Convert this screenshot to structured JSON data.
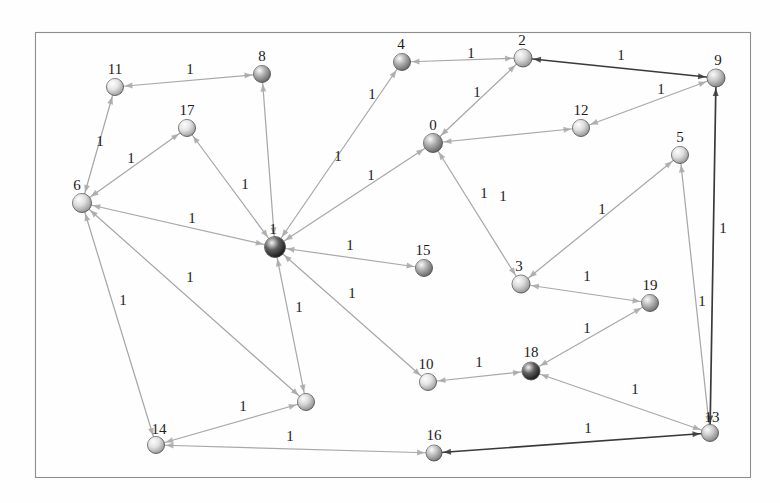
{
  "figure": {
    "type": "node-link-graph",
    "frame": {
      "x": 35,
      "y": 32,
      "width": 715,
      "height": 445,
      "stroke": "#8d8d8d"
    },
    "background": "#fefefe",
    "default_edge_color": "#a8a8a8",
    "highlight_edge_color": "#3a3a3a",
    "node_label_color": "#1c1c1c",
    "edge_label_color": "#1c1c1c"
  },
  "chart_data": {
    "type": "graph",
    "title": "",
    "node_count": 20,
    "edge_count": 27,
    "all_edge_weights_equal": true,
    "weight_value": "1",
    "nodes": [
      {
        "id": "0",
        "label": "0",
        "x": 433,
        "y": 143,
        "r": 9.5,
        "fill": "#8a8a8a",
        "label_dx": 0,
        "label_dy": -13
      },
      {
        "id": "1",
        "label": "1",
        "x": 275,
        "y": 247,
        "r": 10.5,
        "fill": "#1a1a1a",
        "label_dx": -2,
        "label_dy": -13
      },
      {
        "id": "2",
        "label": "2",
        "x": 523,
        "y": 58,
        "r": 9.0,
        "fill": "#c9c9c9",
        "label_dx": -1,
        "label_dy": -13
      },
      {
        "id": "3",
        "label": "3",
        "x": 521,
        "y": 284,
        "r": 9.0,
        "fill": "#cccccc",
        "label_dx": -2,
        "label_dy": -13
      },
      {
        "id": "4",
        "label": "4",
        "x": 402,
        "y": 62,
        "r": 8.5,
        "fill": "#8f8f8f",
        "label_dx": -1,
        "label_dy": -13
      },
      {
        "id": "5",
        "label": "5",
        "x": 680,
        "y": 155,
        "r": 8.5,
        "fill": "#d4d4d4",
        "label_dx": 0,
        "label_dy": -13
      },
      {
        "id": "6",
        "label": "6",
        "x": 82,
        "y": 203,
        "r": 9.5,
        "fill": "#cfcfcf",
        "label_dx": -5,
        "label_dy": -13
      },
      {
        "id": "7",
        "label": "",
        "x": 306,
        "y": 402,
        "r": 8.5,
        "fill": "#c6c6c6",
        "label_dx": 0,
        "label_dy": -13
      },
      {
        "id": "8",
        "label": "8",
        "x": 262,
        "y": 74,
        "r": 8.5,
        "fill": "#8b8b8b",
        "label_dx": 0,
        "label_dy": -13
      },
      {
        "id": "9",
        "label": "9",
        "x": 716,
        "y": 78,
        "r": 9.0,
        "fill": "#b3b3b3",
        "label_dx": 2,
        "label_dy": -13
      },
      {
        "id": "10",
        "label": "10",
        "x": 428,
        "y": 382,
        "r": 8.5,
        "fill": "#dadada",
        "label_dx": -2,
        "label_dy": -13
      },
      {
        "id": "11",
        "label": "11",
        "x": 115,
        "y": 87,
        "r": 8.5,
        "fill": "#dcdcdc",
        "label_dx": 0,
        "label_dy": -13
      },
      {
        "id": "12",
        "label": "12",
        "x": 581,
        "y": 128,
        "r": 8.5,
        "fill": "#d0d0d0",
        "label_dx": 0,
        "label_dy": -13
      },
      {
        "id": "13",
        "label": "13",
        "x": 710,
        "y": 433,
        "r": 8.5,
        "fill": "#b6b6b6",
        "label_dx": 2,
        "label_dy": -11
      },
      {
        "id": "14",
        "label": "14",
        "x": 156,
        "y": 445,
        "r": 8.5,
        "fill": "#d6d6d6",
        "label_dx": 3,
        "label_dy": -11
      },
      {
        "id": "15",
        "label": "15",
        "x": 424,
        "y": 268,
        "r": 8.5,
        "fill": "#8d8d8d",
        "label_dx": -1,
        "label_dy": -13
      },
      {
        "id": "16",
        "label": "16",
        "x": 434,
        "y": 453,
        "r": 8.0,
        "fill": "#a5a5a5",
        "label_dx": 0,
        "label_dy": -13
      },
      {
        "id": "17",
        "label": "17",
        "x": 187,
        "y": 128,
        "r": 8.5,
        "fill": "#dadada",
        "label_dx": 0,
        "label_dy": -13
      },
      {
        "id": "18",
        "label": "18",
        "x": 531,
        "y": 371,
        "r": 9.0,
        "fill": "#1c1c1c",
        "label_dx": 0,
        "label_dy": -14
      },
      {
        "id": "19",
        "label": "19",
        "x": 650,
        "y": 303,
        "r": 8.5,
        "fill": "#9b9b9b",
        "label_dx": 0,
        "label_dy": -13
      }
    ],
    "edges": [
      {
        "from": "8",
        "to": "11",
        "weight": "1",
        "lx": 190,
        "ly": 74,
        "style": "normal"
      },
      {
        "from": "11",
        "to": "6",
        "weight": "1",
        "lx": 100,
        "ly": 146,
        "style": "normal"
      },
      {
        "from": "6",
        "to": "17",
        "weight": "1",
        "lx": 131,
        "ly": 163,
        "style": "normal"
      },
      {
        "from": "17",
        "to": "1",
        "weight": "1",
        "lx": 245,
        "ly": 189,
        "style": "normal"
      },
      {
        "from": "6",
        "to": "1",
        "weight": "1",
        "lx": 192,
        "ly": 223,
        "style": "normal"
      },
      {
        "from": "8",
        "to": "1",
        "weight": "1",
        "lx": 372,
        "ly": 99,
        "style": "normal"
      },
      {
        "from": "4",
        "to": "2",
        "weight": "1",
        "lx": 471,
        "ly": 58,
        "style": "normal"
      },
      {
        "from": "4",
        "to": "1",
        "weight": "1",
        "lx": 338,
        "ly": 161,
        "style": "normal"
      },
      {
        "from": "2",
        "to": "0",
        "weight": "1",
        "lx": 477,
        "ly": 97,
        "style": "normal"
      },
      {
        "from": "2",
        "to": "9",
        "weight": "1",
        "lx": 621,
        "ly": 60,
        "style": "dark"
      },
      {
        "from": "0",
        "to": "1",
        "weight": "1",
        "lx": 371,
        "ly": 180,
        "style": "normal"
      },
      {
        "from": "0",
        "to": "3",
        "weight": "1",
        "lx": 484,
        "ly": 198,
        "style": "normal"
      },
      {
        "from": "12",
        "to": "0",
        "weight": "1",
        "lx": 503,
        "ly": 201,
        "style": "normal"
      },
      {
        "from": "12",
        "to": "9",
        "weight": "1",
        "lx": 661,
        "ly": 94,
        "style": "normal"
      },
      {
        "from": "1",
        "to": "15",
        "weight": "1",
        "lx": 350,
        "ly": 250,
        "style": "normal"
      },
      {
        "from": "5",
        "to": "3",
        "weight": "1",
        "lx": 602,
        "ly": 214,
        "style": "normal"
      },
      {
        "from": "3",
        "to": "19",
        "weight": "1",
        "lx": 587,
        "ly": 281,
        "style": "normal"
      },
      {
        "from": "19",
        "to": "18",
        "weight": "1",
        "lx": 587,
        "ly": 333,
        "style": "normal"
      },
      {
        "from": "18",
        "to": "10",
        "weight": "1",
        "lx": 479,
        "ly": 367,
        "style": "normal"
      },
      {
        "from": "1",
        "to": "10",
        "weight": "1",
        "lx": 352,
        "ly": 298,
        "style": "normal"
      },
      {
        "from": "1",
        "to": "7",
        "weight": "1",
        "lx": 299,
        "ly": 312,
        "style": "normal"
      },
      {
        "from": "6",
        "to": "7",
        "weight": "1",
        "lx": 190,
        "ly": 282,
        "style": "normal"
      },
      {
        "from": "6",
        "to": "14",
        "weight": "1",
        "lx": 123,
        "ly": 305,
        "style": "normal"
      },
      {
        "from": "7",
        "to": "14",
        "weight": "1",
        "lx": 243,
        "ly": 411,
        "style": "normal"
      },
      {
        "from": "14",
        "to": "16",
        "weight": "1",
        "lx": 290,
        "ly": 441,
        "style": "normal"
      },
      {
        "from": "16",
        "to": "13",
        "weight": "1",
        "lx": 588,
        "ly": 433,
        "style": "dark"
      },
      {
        "from": "18",
        "to": "13",
        "weight": "1",
        "lx": 635,
        "ly": 394,
        "style": "normal"
      },
      {
        "from": "5",
        "to": "13",
        "weight": "1",
        "lx": 702,
        "ly": 306,
        "style": "normal"
      },
      {
        "from": "9",
        "to": "13",
        "weight": "1",
        "lx": 723,
        "ly": 233,
        "style": "dark"
      }
    ]
  }
}
